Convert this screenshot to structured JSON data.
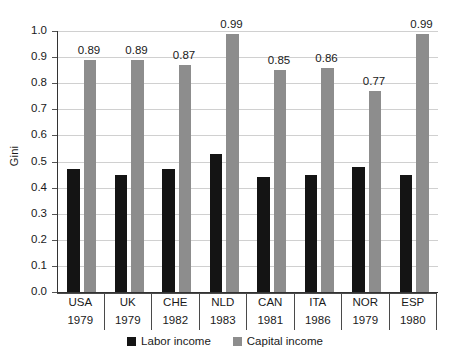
{
  "chart_data": {
    "type": "bar",
    "title": "",
    "xlabel": "",
    "ylabel": "Gini",
    "ylim": [
      0.0,
      1.0
    ],
    "grid": true,
    "legend_position": "bottom-center",
    "categories": [
      "USA",
      "UK",
      "CHE",
      "NLD",
      "CAN",
      "ITA",
      "NOR",
      "ESP"
    ],
    "category_years": [
      "1979",
      "1979",
      "1982",
      "1983",
      "1981",
      "1986",
      "1979",
      "1980"
    ],
    "y_ticks": [
      "0.0",
      "0.1",
      "0.2",
      "0.3",
      "0.4",
      "0.5",
      "0.6",
      "0.7",
      "0.8",
      "0.9",
      "1.0"
    ],
    "series": [
      {
        "name": "Labor income",
        "color": "#141414",
        "values": [
          0.47,
          0.45,
          0.47,
          0.53,
          0.44,
          0.45,
          0.48,
          0.45
        ],
        "labels": [
          "",
          "",
          "",
          "",
          "",
          "",
          "",
          ""
        ]
      },
      {
        "name": "Capital income",
        "color": "#8d8d8d",
        "values": [
          0.89,
          0.89,
          0.87,
          0.99,
          0.85,
          0.86,
          0.77,
          0.99
        ],
        "labels": [
          "0.89",
          "0.89",
          "0.87",
          "0.99",
          "0.85",
          "0.86",
          "0.77",
          "0.99"
        ]
      }
    ]
  },
  "legend": {
    "items": [
      {
        "label": "Labor income",
        "color": "#141414"
      },
      {
        "label": "Capital income",
        "color": "#8d8d8d"
      }
    ]
  }
}
